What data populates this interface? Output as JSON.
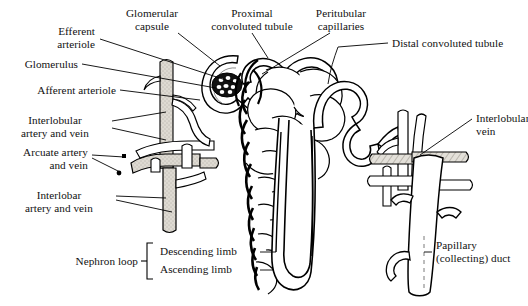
{
  "figure": {
    "type": "anatomical-diagram",
    "background_color": "#ffffff",
    "line_color": "#000000",
    "vessel_fill_color": "#d9d6cf",
    "text_color": "#111111"
  },
  "labels": {
    "efferent_arteriole": "Efferent\narteriole",
    "glomerular_capsule": "Glomerular\ncapsule",
    "proximal_convoluted_tubule": "Proximal\nconvoluted tubule",
    "peritubular_capillaries": "Peritubular\ncapillaries",
    "distal_convoluted_tubule": "Distal convoluted tubule",
    "glomerulus": "Glomerulus",
    "afferent_arteriole": "Afferent arteriole",
    "interlobular_artery_and_vein": "Interlobular\nartery and vein",
    "arcuate_artery_and_vein": "Arcuate artery\nand vein",
    "interlobar_artery_and_vein": "Interlobar\nartery and vein",
    "interlobular_vein": "Interlobular\nvein",
    "nephron_loop": "Nephron loop",
    "descending_limb": "Descending limb",
    "ascending_limb": "Ascending limb",
    "papillary_collecting_duct": "Papillary\n(collecting) duct"
  }
}
